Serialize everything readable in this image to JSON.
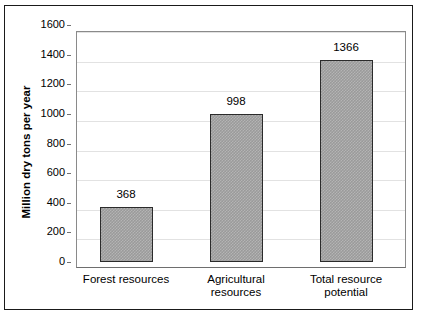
{
  "chart_data": {
    "type": "bar",
    "title": "",
    "xlabel": "",
    "ylabel": "Million dry tons per year",
    "categories": [
      "Forest resources",
      "Agricultural resources",
      "Total resource potential"
    ],
    "category_lines": [
      [
        "Forest resources"
      ],
      [
        "Agricultural",
        "resources"
      ],
      [
        "Total resource",
        "potential"
      ]
    ],
    "values": [
      368,
      998,
      1366
    ],
    "value_labels": [
      "368",
      "998",
      "1366"
    ],
    "ylim": [
      0,
      1600
    ],
    "ytick_values": [
      0,
      200,
      400,
      600,
      800,
      1000,
      1200,
      1400,
      1600
    ],
    "ytick_labels": [
      "0",
      "200",
      "400",
      "600",
      "800",
      "1000",
      "1200",
      "1400",
      "1600"
    ],
    "grid": true,
    "grid_axis": "y",
    "legend": false,
    "legend_position": "none",
    "bar_fill": "#9a9a9a",
    "bar_edge": "#2b2b2b",
    "grid_color": "#e2e2e2",
    "axis_color": "#8a8a8a",
    "frame_color": "#1a1a1a",
    "background": "#ffffff"
  }
}
